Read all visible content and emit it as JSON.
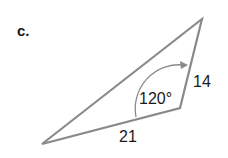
{
  "problem": {
    "part_label": "c.",
    "angle_label": "120°",
    "side_a_label": "14",
    "side_b_label": "21"
  },
  "colors": {
    "line": "#8a8a8a",
    "text": "#1a1a1a"
  }
}
